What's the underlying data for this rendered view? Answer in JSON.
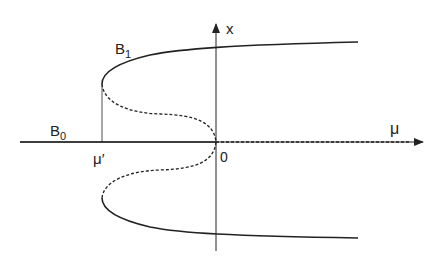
{
  "figure": {
    "type": "bifurcation-diagram",
    "axes": {
      "horizontal_label": "μ",
      "vertical_label": "x",
      "origin_label": "0"
    },
    "points": {
      "fold_label": "μ′"
    },
    "branches": {
      "trivial_label": "B",
      "trivial_sub": "0",
      "nontrivial_label": "B",
      "nontrivial_sub": "1"
    },
    "legend": {
      "solid": "stable",
      "dashed": "unstable"
    },
    "colors": {
      "ink": "#222222",
      "background": "#ffffff"
    }
  }
}
